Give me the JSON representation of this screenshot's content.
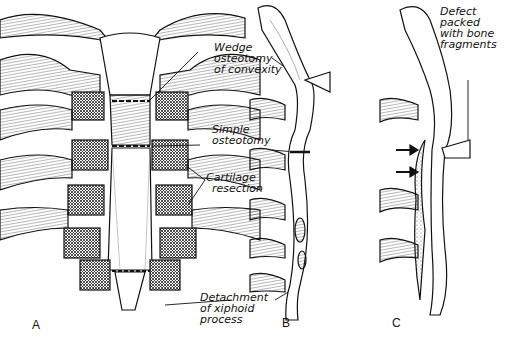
{
  "figure": {
    "panels": [
      {
        "id": "A",
        "label": "A"
      },
      {
        "id": "B",
        "label": "B"
      },
      {
        "id": "C",
        "label": "C"
      }
    ],
    "annotations": {
      "wedge": [
        "Wedge",
        "osteotomy",
        "of convexity"
      ],
      "simple": [
        "Simple",
        "osteotomy"
      ],
      "cartilage": [
        "Cartilage",
        "resection"
      ],
      "detachment": [
        "Detachment",
        "of xiphoid",
        "process"
      ],
      "defect": [
        "Defect",
        "packed",
        "with bone",
        "fragments"
      ]
    },
    "colors": {
      "ink": "#111111",
      "paper": "#ffffff",
      "hatch": "#555555"
    }
  }
}
